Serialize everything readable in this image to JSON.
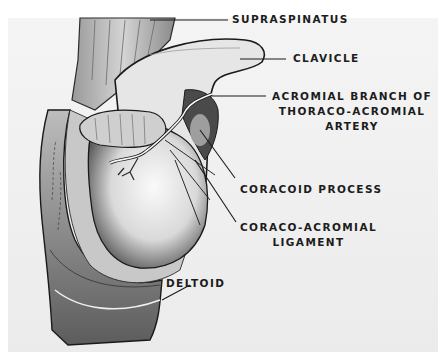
{
  "figure": {
    "type": "anatomical illustration",
    "colors": {
      "background": "#ffffff",
      "plate": "#efefef",
      "ink": "#1c1c1c",
      "artery": "#f8f8f8"
    },
    "labels": [
      {
        "id": "supraspinatus",
        "text": "SUPRASPINATUS"
      },
      {
        "id": "clavicle",
        "text": "CLAVICLE"
      },
      {
        "id": "acromial-branch",
        "lines": [
          "ACROMIAL BRANCH OF",
          "THORACO-ACROMIAL",
          "ARTERY"
        ]
      },
      {
        "id": "coracoid-process",
        "text": "CORACOID PROCESS"
      },
      {
        "id": "coraco-acromial-ligament",
        "lines": [
          "CORACO-ACROMIAL",
          "LIGAMENT"
        ]
      },
      {
        "id": "deltoid",
        "text": "DELTOID"
      }
    ]
  }
}
